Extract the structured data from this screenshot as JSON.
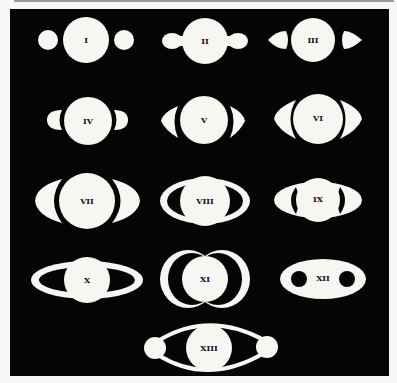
{
  "colors": {
    "background": "#050505",
    "figure": "#f6f6f2",
    "label": "#111111",
    "page": "#f7f7f5"
  },
  "figures": [
    {
      "label": "I"
    },
    {
      "label": "II"
    },
    {
      "label": "III"
    },
    {
      "label": "IV"
    },
    {
      "label": "V"
    },
    {
      "label": "VI"
    },
    {
      "label": "VII"
    },
    {
      "label": "VIII"
    },
    {
      "label": "IX"
    },
    {
      "label": "X"
    },
    {
      "label": "XI"
    },
    {
      "label": "XII"
    },
    {
      "label": "XIII"
    }
  ]
}
